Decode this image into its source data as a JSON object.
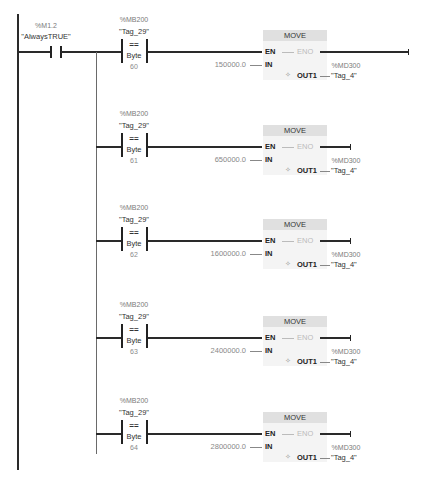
{
  "network": {
    "enable_contact": {
      "address": "%M1.2",
      "name": "\"AlwaysTRUE\""
    },
    "rungs": [
      {
        "compare": {
          "address": "%MB200",
          "name": "\"Tag_29\"",
          "operator": "==",
          "type": "Byte",
          "value": "60"
        },
        "move": {
          "title": "MOVE",
          "en": "EN",
          "eno": "ENO",
          "in_pin": "IN",
          "out_pin": "OUT1",
          "in_value": "150000.0",
          "out_address": "%MD300",
          "out_name": "\"Tag_4\""
        }
      },
      {
        "compare": {
          "address": "%MB200",
          "name": "\"Tag_29\"",
          "operator": "==",
          "type": "Byte",
          "value": "61"
        },
        "move": {
          "title": "MOVE",
          "en": "EN",
          "eno": "ENO",
          "in_pin": "IN",
          "out_pin": "OUT1",
          "in_value": "650000.0",
          "out_address": "%MD300",
          "out_name": "\"Tag_4\""
        }
      },
      {
        "compare": {
          "address": "%MB200",
          "name": "\"Tag_29\"",
          "operator": "==",
          "type": "Byte",
          "value": "62"
        },
        "move": {
          "title": "MOVE",
          "en": "EN",
          "eno": "ENO",
          "in_pin": "IN",
          "out_pin": "OUT1",
          "in_value": "1600000.0",
          "out_address": "%MD300",
          "out_name": "\"Tag_4\""
        }
      },
      {
        "compare": {
          "address": "%MB200",
          "name": "\"Tag_29\"",
          "operator": "==",
          "type": "Byte",
          "value": "63"
        },
        "move": {
          "title": "MOVE",
          "en": "EN",
          "eno": "ENO",
          "in_pin": "IN",
          "out_pin": "OUT1",
          "in_value": "2400000.0",
          "out_address": "%MD300",
          "out_name": "\"Tag_4\""
        }
      },
      {
        "compare": {
          "address": "%MB200",
          "name": "\"Tag_29\"",
          "operator": "==",
          "type": "Byte",
          "value": "64"
        },
        "move": {
          "title": "MOVE",
          "en": "EN",
          "eno": "ENO",
          "in_pin": "IN",
          "out_pin": "OUT1",
          "in_value": "2800000.0",
          "out_address": "%MD300",
          "out_name": "\"Tag_4\""
        }
      }
    ]
  },
  "icons": {
    "out_icon": "✧"
  }
}
